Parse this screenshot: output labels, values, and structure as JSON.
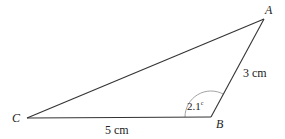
{
  "diagram": {
    "type": "triangle",
    "vertices": {
      "A": {
        "label": "A"
      },
      "B": {
        "label": "B"
      },
      "C": {
        "label": "C"
      }
    },
    "sides": {
      "AB": {
        "label": "3 cm",
        "length_cm": 3
      },
      "BC": {
        "label": "5 cm",
        "length_cm": 5
      },
      "CA": {
        "label": ""
      }
    },
    "angle_B": {
      "label_value": "2.1",
      "label_unit": "c",
      "radians": 2.1
    }
  }
}
